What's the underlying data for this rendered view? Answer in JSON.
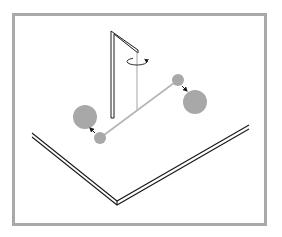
{
  "diagram": {
    "colors": {
      "background": "#ffffff",
      "frame": "#a9a9a9",
      "sphere": "#a8a8a8",
      "rod": "#b5b5b5",
      "fiber": "#9a9a9a",
      "line": "#1a1a1a"
    },
    "frame": {
      "x": 12,
      "y": 13,
      "width": 255,
      "height": 213
    },
    "support": {
      "post": {
        "x": 112,
        "y_top": 31,
        "y_bottom": 118
      },
      "arm": {
        "x1": 112,
        "y1": 31,
        "x2": 137,
        "y2": 51
      }
    },
    "fiber": {
      "x": 137,
      "y_top": 51,
      "y_bottom": 110
    },
    "rotation_arrow": {
      "cx": 137,
      "cy": 61,
      "rx": 10,
      "ry": 3.5
    },
    "rod": {
      "x1": 100,
      "y1": 138,
      "x2": 178,
      "y2": 80
    },
    "small_spheres": [
      {
        "cx": 100,
        "cy": 138,
        "r": 6
      },
      {
        "cx": 178,
        "cy": 80,
        "r": 6
      }
    ],
    "large_spheres": [
      {
        "cx": 85,
        "cy": 117,
        "r": 12
      },
      {
        "cx": 195,
        "cy": 102,
        "r": 12
      }
    ],
    "attraction_arrows": [
      {
        "from": [
          95,
          133
        ],
        "to": [
          90,
          128
        ]
      },
      {
        "from": [
          181,
          86
        ],
        "to": [
          187,
          92
        ]
      }
    ],
    "table": {
      "left_edge": {
        "x1": 32,
        "y1": 134,
        "x2": 117,
        "y2": 204
      },
      "right_edge": {
        "x1": 117,
        "y1": 204,
        "x2": 249,
        "y2": 127
      },
      "thickness": 4
    }
  }
}
